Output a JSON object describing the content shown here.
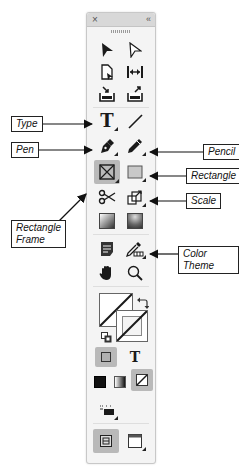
{
  "panel": {
    "title_close": "×",
    "title_collapse": "‹‹",
    "tools": [
      {
        "name": "selection-tool",
        "icon": "black-arrow-icon"
      },
      {
        "name": "direct-selection-tool",
        "icon": "white-arrow-icon"
      },
      {
        "name": "page-tool",
        "icon": "page-icon"
      },
      {
        "name": "gap-tool",
        "icon": "gap-icon"
      },
      {
        "name": "content-collector-tool",
        "icon": "collector-icon"
      },
      {
        "name": "content-placer-tool",
        "icon": "placer-icon"
      },
      {
        "name": "type-tool",
        "icon": "type-icon",
        "glyph": "T"
      },
      {
        "name": "line-tool",
        "icon": "line-icon"
      },
      {
        "name": "pen-tool",
        "icon": "pen-icon"
      },
      {
        "name": "pencil-tool",
        "icon": "pencil-icon"
      },
      {
        "name": "rectangle-frame-tool",
        "icon": "rectangle-frame-icon",
        "selected": true
      },
      {
        "name": "rectangle-tool",
        "icon": "rectangle-icon"
      },
      {
        "name": "scissors-tool",
        "icon": "scissors-icon"
      },
      {
        "name": "free-transform-tool",
        "icon": "scale-icon"
      },
      {
        "name": "gradient-swatch-tool",
        "icon": "gradient-swatch-icon"
      },
      {
        "name": "gradient-feather-tool",
        "icon": "gradient-feather-icon"
      },
      {
        "name": "note-tool",
        "icon": "note-icon"
      },
      {
        "name": "color-theme-tool",
        "icon": "eyedropper-icon"
      },
      {
        "name": "hand-tool",
        "icon": "hand-icon"
      },
      {
        "name": "zoom-tool",
        "icon": "magnifier-icon"
      },
      {
        "name": "format-container",
        "icon": "container-icon"
      },
      {
        "name": "format-text",
        "icon": "text-format-icon",
        "glyph": "T"
      },
      {
        "name": "apply-color",
        "icon": "color-icon"
      },
      {
        "name": "apply-gradient",
        "icon": "gradient-icon"
      },
      {
        "name": "apply-none",
        "icon": "none-icon"
      },
      {
        "name": "view-mode",
        "icon": "view-mode-icon"
      },
      {
        "name": "screen-mode",
        "icon": "screen-mode-icon"
      }
    ]
  },
  "callouts": {
    "type": "Type",
    "pen": "Pen",
    "pencil": "Pencil",
    "rectangle": "Rectangle",
    "rectangle_frame_1": "Rectangle",
    "rectangle_frame_2": "Frame",
    "scale": "Scale",
    "color_theme": "Color Theme"
  },
  "colors": {
    "panel_bg": "#f4f4f4",
    "selected_bg": "#b9b9b9",
    "icon": "#222222"
  }
}
